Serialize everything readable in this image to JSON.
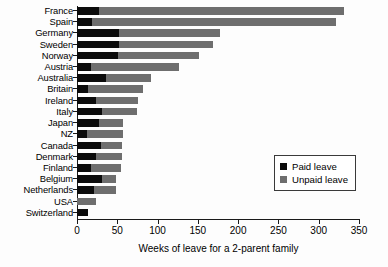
{
  "chart_data": {
    "type": "bar",
    "orientation": "horizontal",
    "stacked": true,
    "title": "",
    "xlabel": "Weeks of leave for a 2-parent family",
    "ylabel": "",
    "xlim": [
      0,
      350
    ],
    "xticks": [
      0,
      50,
      100,
      150,
      200,
      250,
      300,
      350
    ],
    "grid": false,
    "legend_position": "inner-right",
    "categories": [
      "France",
      "Spain",
      "Germany",
      "Sweden",
      "Norway",
      "Austria",
      "Australia",
      "Britain",
      "Ireland",
      "Italy",
      "Japan",
      "NZ",
      "Canada",
      "Denmark",
      "Finland",
      "Belgium",
      "Netherlands",
      "USA",
      "Switzerland"
    ],
    "series": [
      {
        "name": "Paid leave",
        "color": "#0b0b0b",
        "values": [
          27,
          18,
          52,
          52,
          51,
          17,
          36,
          14,
          24,
          31,
          27,
          13,
          30,
          24,
          17,
          31,
          21,
          0,
          14
        ]
      },
      {
        "name": "Unpaid leave",
        "color": "#6e6e6e",
        "values": [
          305,
          304,
          126,
          117,
          100,
          110,
          56,
          68,
          52,
          43,
          30,
          44,
          26,
          32,
          38,
          17,
          27,
          24,
          0
        ]
      }
    ],
    "totals": [
      332,
      322,
      178,
      169,
      151,
      127,
      92,
      82,
      76,
      74,
      57,
      57,
      56,
      56,
      55,
      48,
      48,
      24,
      14
    ]
  },
  "legend": {
    "items": [
      {
        "label": "Paid leave",
        "color": "#0b0b0b"
      },
      {
        "label": "Unpaid leave",
        "color": "#6e6e6e"
      }
    ]
  },
  "axis": {
    "x_title": "Weeks of leave for a 2-parent family",
    "x_tick_labels": [
      "0",
      "50",
      "100",
      "150",
      "200",
      "250",
      "300",
      "350"
    ]
  }
}
